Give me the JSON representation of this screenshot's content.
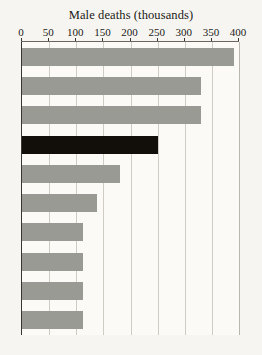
{
  "chart_data": {
    "type": "bar",
    "orientation": "horizontal",
    "title": "Male deaths (thousands)",
    "xlabel": "",
    "ylabel": "",
    "xlim": [
      0,
      400
    ],
    "ticks": [
      0,
      50,
      100,
      150,
      200,
      250,
      300,
      350,
      400
    ],
    "tick_labels": [
      "0",
      "50",
      "100",
      "150",
      "200",
      "250",
      "300",
      "350",
      "400"
    ],
    "grid": true,
    "legend": "none",
    "categories": [
      "",
      "",
      "",
      "",
      "",
      "",
      "",
      "",
      "",
      ""
    ],
    "values": [
      390,
      330,
      330,
      250,
      180,
      138,
      112,
      112,
      112,
      112
    ],
    "bar_colors": [
      "#9a9a95",
      "#9a9a95",
      "#9a9a95",
      "#120f0b",
      "#9a9a95",
      "#9a9a95",
      "#9a9a95",
      "#9a9a95",
      "#9a9a95",
      "#9a9a95"
    ],
    "highlight_index": 3,
    "colors": {
      "bar_gray": "#9a9a95",
      "bar_black": "#120f0b",
      "plot_background": "#fbfaf7",
      "page_background": "#f6f5f1",
      "gridline": "#cfccc4",
      "axis": "#3a3733",
      "text": "#1b1a17"
    }
  }
}
